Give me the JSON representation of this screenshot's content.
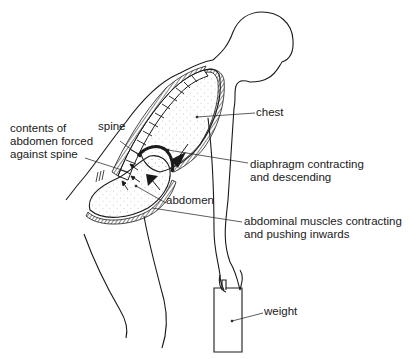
{
  "figure": {
    "labels": {
      "chest": "chest",
      "spine": "spine",
      "contents_line1": "contents of",
      "contents_line2": "abdomen forced",
      "contents_line3": "against spine",
      "diaphragm_line1": "diaphragm contracting",
      "diaphragm_line2": "and descending",
      "abdomen": "abdomen",
      "muscles_line1": "abdominal muscles contracting",
      "muscles_line2": "and pushing inwards",
      "weight": "weight"
    },
    "colors": {
      "ink": "#1a1a1a",
      "background": "#ffffff",
      "stipple": "#9a9a9a"
    }
  }
}
